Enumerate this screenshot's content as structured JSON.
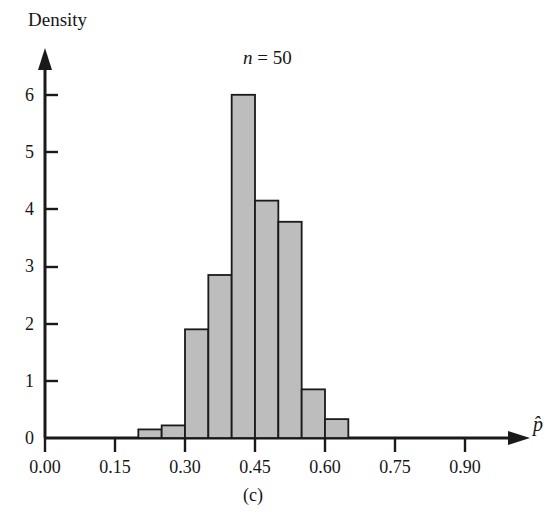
{
  "figure": {
    "panel_caption": "(c)",
    "y_axis_title": "Density",
    "x_axis_title": "p̂",
    "annotation_n": "n = 50",
    "annotation_n_symbol": "n",
    "annotation_n_value": "= 50",
    "bar_fill_color": "#bdbdbd",
    "bar_stroke_color": "#1a1a1a",
    "axis_color": "#1a1a1a",
    "background_color": "#ffffff"
  },
  "chart_data": {
    "type": "bar",
    "title": "",
    "subtitle": "n = 50",
    "xlabel": "p̂",
    "ylabel": "Density",
    "grid": false,
    "legend": false,
    "xlim": [
      0.0,
      1.0
    ],
    "ylim": [
      0,
      6.6
    ],
    "xticks": [
      0.0,
      0.15,
      0.3,
      0.45,
      0.6,
      0.75,
      0.9
    ],
    "xticklabels": [
      "0.00",
      "0.15",
      "0.30",
      "0.45",
      "0.60",
      "0.75",
      "0.90"
    ],
    "yticks": [
      0,
      1,
      2,
      3,
      4,
      5,
      6
    ],
    "yticklabels": [
      "0",
      "1",
      "2",
      "3",
      "4",
      "5",
      "6"
    ],
    "bin_width": 0.05,
    "bin_edges": [
      0.2,
      0.25,
      0.3,
      0.35,
      0.4,
      0.45,
      0.5,
      0.55,
      0.6,
      0.65
    ],
    "categories": [
      "0.20-0.25",
      "0.25-0.30",
      "0.30-0.35",
      "0.35-0.40",
      "0.40-0.45",
      "0.45-0.50",
      "0.50-0.55",
      "0.55-0.60",
      "0.60-0.65"
    ],
    "values": [
      0.15,
      0.22,
      1.9,
      2.85,
      6.0,
      4.15,
      3.78,
      0.85,
      0.33
    ]
  }
}
